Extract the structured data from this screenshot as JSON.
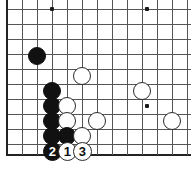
{
  "diagram": {
    "kind": "go-board-diagram",
    "board": {
      "width_px": 191,
      "height_px": 172,
      "cell_px": 15,
      "origin_x_px": 7,
      "origin_y_px": 9,
      "cols": 13,
      "rows": 10,
      "line_color": "#555555",
      "edge_color": "#222222",
      "background_color": "#ffffff",
      "bottom_edge_y_px": 155
    },
    "star_points": [
      {
        "x_px": 52,
        "y_px": 9
      },
      {
        "x_px": 147,
        "y_px": 9
      },
      {
        "x_px": 147,
        "y_px": 106
      }
    ],
    "stones": [
      {
        "color": "black",
        "x_px": 37,
        "y_px": 56,
        "r_px": 9,
        "label": ""
      },
      {
        "color": "white",
        "x_px": 82,
        "y_px": 76,
        "r_px": 9,
        "label": ""
      },
      {
        "color": "black",
        "x_px": 52,
        "y_px": 91,
        "r_px": 9,
        "label": ""
      },
      {
        "color": "white",
        "x_px": 142,
        "y_px": 91,
        "r_px": 9,
        "label": ""
      },
      {
        "color": "black",
        "x_px": 52,
        "y_px": 106,
        "r_px": 9,
        "label": ""
      },
      {
        "color": "white",
        "x_px": 67,
        "y_px": 106,
        "r_px": 9,
        "label": ""
      },
      {
        "color": "black",
        "x_px": 52,
        "y_px": 121,
        "r_px": 9,
        "label": ""
      },
      {
        "color": "white",
        "x_px": 67,
        "y_px": 121,
        "r_px": 9,
        "label": ""
      },
      {
        "color": "white",
        "x_px": 97,
        "y_px": 121,
        "r_px": 9,
        "label": ""
      },
      {
        "color": "white",
        "x_px": 172,
        "y_px": 121,
        "r_px": 9,
        "label": ""
      },
      {
        "color": "black",
        "x_px": 52,
        "y_px": 136,
        "r_px": 9,
        "label": ""
      },
      {
        "color": "black",
        "x_px": 67,
        "y_px": 136,
        "r_px": 9,
        "label": ""
      },
      {
        "color": "white",
        "x_px": 82,
        "y_px": 136,
        "r_px": 9,
        "label": ""
      },
      {
        "color": "black",
        "x_px": 52,
        "y_px": 151,
        "r_px": 9.5,
        "label": "2"
      },
      {
        "color": "white",
        "x_px": 67,
        "y_px": 151,
        "r_px": 9.5,
        "label": "1"
      },
      {
        "color": "white",
        "x_px": 82,
        "y_px": 151,
        "r_px": 9.5,
        "label": "3"
      }
    ],
    "move_numbers": [
      {
        "number": "1",
        "color": "white"
      },
      {
        "number": "2",
        "color": "black"
      },
      {
        "number": "3",
        "color": "white"
      }
    ]
  }
}
